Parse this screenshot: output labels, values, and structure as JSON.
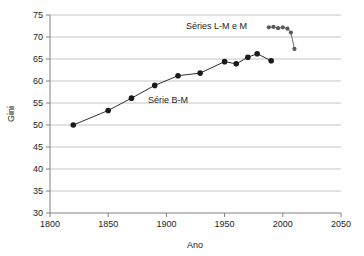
{
  "chart_data": {
    "type": "line",
    "title": "",
    "xlabel": "Ano",
    "ylabel": "Gini",
    "xlim": [
      1800,
      2050
    ],
    "ylim": [
      30,
      75
    ],
    "xticks": [
      1800,
      1850,
      1900,
      1950,
      2000,
      2050
    ],
    "yticks": [
      30,
      35,
      40,
      45,
      50,
      55,
      60,
      65,
      70,
      75
    ],
    "grid": "horizontal",
    "legend": "inline-annotations",
    "annotations": [
      {
        "text": "Séries L-M e M",
        "x": 1965,
        "y": 72.6
      },
      {
        "text": "Série B-M",
        "x": 1895,
        "y": 56.2
      }
    ],
    "series": [
      {
        "name": "Série B-M",
        "marker": "circle-filled",
        "color": "#1a1a1a",
        "line": true,
        "points": [
          {
            "x": 1820,
            "y": 50.0
          },
          {
            "x": 1850,
            "y": 53.3
          },
          {
            "x": 1870,
            "y": 56.1
          },
          {
            "x": 1890,
            "y": 59.0
          },
          {
            "x": 1910,
            "y": 61.2
          },
          {
            "x": 1929,
            "y": 61.8
          },
          {
            "x": 1950,
            "y": 64.4
          },
          {
            "x": 1960,
            "y": 63.9
          },
          {
            "x": 1970,
            "y": 65.4
          },
          {
            "x": 1978,
            "y": 66.2
          },
          {
            "x": 1990,
            "y": 64.6
          }
        ]
      },
      {
        "name": "Séries L-M e M",
        "marker": "circle-small",
        "color": "#5a5a5a",
        "line": true,
        "points": [
          {
            "x": 1988,
            "y": 72.2
          },
          {
            "x": 1992,
            "y": 72.3
          },
          {
            "x": 1996,
            "y": 72.0
          },
          {
            "x": 2000,
            "y": 72.2
          },
          {
            "x": 2004,
            "y": 71.9
          },
          {
            "x": 2007,
            "y": 71.0
          },
          {
            "x": 2010,
            "y": 67.3
          }
        ]
      }
    ]
  },
  "axes": {
    "x_tick_labels": [
      "1800",
      "1850",
      "1900",
      "1950",
      "2000",
      "2050"
    ],
    "y_tick_labels": [
      "30",
      "35",
      "40",
      "45",
      "50",
      "55",
      "60",
      "65",
      "70",
      "75"
    ],
    "x_title": "Ano",
    "y_title": "Gini"
  },
  "labels": {
    "series_top": "Séries L-M e M",
    "series_main": "Série B-M"
  },
  "colors": {
    "background": "#ffffff",
    "axis": "#808080",
    "grid": "#b5b5b5",
    "series_main": "#1a1a1a",
    "series_top": "#5a5a5a",
    "text": "#1d1d1d"
  }
}
